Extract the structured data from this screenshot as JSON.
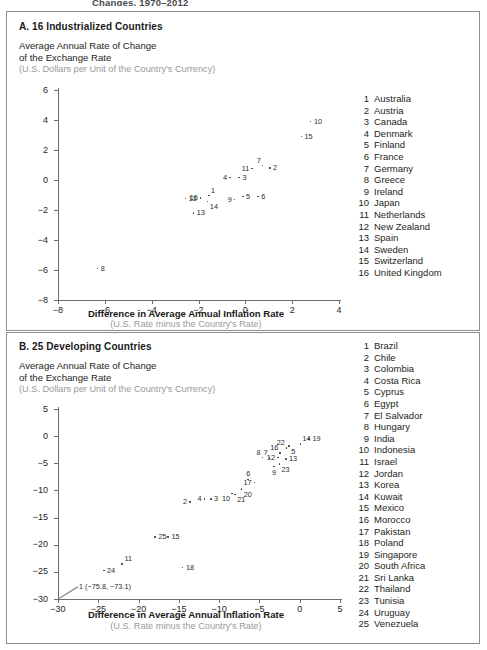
{
  "page": {
    "cut_off_heading": "Changes, 1970–2012"
  },
  "panel_a": {
    "title": "A. 16 Industrialized Countries",
    "ylabel_line1": "Average Annual Rate of Change",
    "ylabel_line2": "of the Exchange Rate",
    "ylabel_units": "(U.S. Dollars per Unit of the Country's Currency)",
    "xtitle": "Difference in Average Annual Inflation Rate",
    "xsub": "(U.S. Rate minus the Country's Rate)",
    "legend": [
      {
        "num": "1",
        "name": "Australia"
      },
      {
        "num": "2",
        "name": "Austria"
      },
      {
        "num": "3",
        "name": "Canada"
      },
      {
        "num": "4",
        "name": "Denmark"
      },
      {
        "num": "5",
        "name": "Finland"
      },
      {
        "num": "6",
        "name": "France"
      },
      {
        "num": "7",
        "name": "Germany"
      },
      {
        "num": "8",
        "name": "Greece"
      },
      {
        "num": "9",
        "name": "Ireland"
      },
      {
        "num": "10",
        "name": "Japan"
      },
      {
        "num": "11",
        "name": "Netherlands"
      },
      {
        "num": "12",
        "name": "New Zealand"
      },
      {
        "num": "13",
        "name": "Spain"
      },
      {
        "num": "14",
        "name": "Sweden"
      },
      {
        "num": "15",
        "name": "Switzerland"
      },
      {
        "num": "16",
        "name": "United Kingdom"
      }
    ]
  },
  "panel_b": {
    "title": "B. 25 Developing Countries",
    "ylabel_line1": "Average Annual Rate of Change",
    "ylabel_line2": "of the Exchange Rate",
    "ylabel_units": "(U.S. Dollars per Unit of the Country's Currency)",
    "xtitle": "Difference in Average Annual Inflation Rate",
    "xsub": "(U.S. Rate minus the Country's Rate)",
    "outlier_annotation": "1 (−75.8, −73.1)",
    "legend": [
      {
        "num": "1",
        "name": "Brazil"
      },
      {
        "num": "2",
        "name": "Chile"
      },
      {
        "num": "3",
        "name": "Colombia"
      },
      {
        "num": "4",
        "name": "Costa Rica"
      },
      {
        "num": "5",
        "name": "Cyprus"
      },
      {
        "num": "6",
        "name": "Egypt"
      },
      {
        "num": "7",
        "name": "El Salvador"
      },
      {
        "num": "8",
        "name": "Hungary"
      },
      {
        "num": "9",
        "name": "India"
      },
      {
        "num": "10",
        "name": "Indonesia"
      },
      {
        "num": "11",
        "name": "Israel"
      },
      {
        "num": "12",
        "name": "Jordan"
      },
      {
        "num": "13",
        "name": "Korea"
      },
      {
        "num": "14",
        "name": "Kuwait"
      },
      {
        "num": "15",
        "name": "Mexico"
      },
      {
        "num": "16",
        "name": "Morocco"
      },
      {
        "num": "17",
        "name": "Pakistan"
      },
      {
        "num": "18",
        "name": "Poland"
      },
      {
        "num": "19",
        "name": "Singapore"
      },
      {
        "num": "20",
        "name": "South Africa"
      },
      {
        "num": "21",
        "name": "Sri Lanka"
      },
      {
        "num": "22",
        "name": "Thailand"
      },
      {
        "num": "23",
        "name": "Tunisia"
      },
      {
        "num": "24",
        "name": "Uruguay"
      },
      {
        "num": "25",
        "name": "Venezuela"
      }
    ]
  },
  "chart_data": [
    {
      "type": "scatter",
      "title": "A. 16 Industrialized Countries",
      "xlabel": "Difference in Average Annual Inflation Rate (U.S. Rate minus the Country's Rate)",
      "ylabel": "Average Annual Rate of Change of the Exchange Rate (U.S. Dollars per Unit of the Country's Currency)",
      "xlim": [
        -8,
        4
      ],
      "ylim": [
        -8,
        6
      ],
      "xticks": [
        -8,
        -6,
        -4,
        -2,
        0,
        2,
        4
      ],
      "yticks": [
        -8,
        -6,
        -4,
        -2,
        0,
        2,
        4,
        6
      ],
      "grid": false,
      "legend_position": "right",
      "points": [
        {
          "label": "1",
          "name": "Australia",
          "x": -1.55,
          "y": -1.05,
          "lab": "lab-tr"
        },
        {
          "label": "2",
          "name": "Austria",
          "x": 1.05,
          "y": 0.8,
          "lab": "lab-r"
        },
        {
          "label": "3",
          "name": "Canada",
          "x": -0.25,
          "y": 0.15,
          "lab": "lab-r"
        },
        {
          "label": "4",
          "name": "Denmark",
          "x": -0.65,
          "y": 0.15,
          "lab": "lab-l"
        },
        {
          "label": "5",
          "name": "Finland",
          "x": -0.1,
          "y": -1.1,
          "lab": "lab-r"
        },
        {
          "label": "6",
          "name": "France",
          "x": 0.55,
          "y": -1.1,
          "lab": "lab-r"
        },
        {
          "label": "7",
          "name": "Germany",
          "x": 0.75,
          "y": 0.95,
          "lab": "lab-tl"
        },
        {
          "label": "8",
          "name": "Greece",
          "x": -6.3,
          "y": -5.9,
          "lab": "lab-r"
        },
        {
          "label": "9",
          "name": "Ireland",
          "x": -0.45,
          "y": -1.3,
          "lab": "lab-l"
        },
        {
          "label": "10",
          "name": "Japan",
          "x": 2.8,
          "y": 3.9,
          "lab": "lab-r"
        },
        {
          "label": "11",
          "name": "Netherlands",
          "x": 0.3,
          "y": 0.75,
          "lab": "lab-l"
        },
        {
          "label": "12",
          "name": "New Zealand",
          "x": -2.55,
          "y": -1.25,
          "lab": "lab-r"
        },
        {
          "label": "13",
          "name": "Spain",
          "x": -2.2,
          "y": -2.2,
          "lab": "lab-r"
        },
        {
          "label": "14",
          "name": "Sweden",
          "x": -1.6,
          "y": -1.45,
          "lab": "lab-br"
        },
        {
          "label": "15",
          "name": "Switzerland",
          "x": 2.4,
          "y": 2.9,
          "lab": "lab-r"
        },
        {
          "label": "16",
          "name": "United Kingdom",
          "x": -1.9,
          "y": -1.2,
          "lab": "lab-l"
        }
      ]
    },
    {
      "type": "scatter",
      "title": "B. 25 Developing Countries",
      "xlabel": "Difference in Average Annual Inflation Rate (U.S. Rate minus the Country's Rate)",
      "ylabel": "Average Annual Rate of Change of the Exchange Rate (U.S. Dollars per Unit of the Country's Currency)",
      "xlim": [
        -30,
        5
      ],
      "ylim": [
        -30,
        5
      ],
      "xticks": [
        -30,
        -25,
        -20,
        -15,
        -10,
        -5,
        0,
        5
      ],
      "yticks": [
        -30,
        -25,
        -20,
        -15,
        -10,
        -5,
        0,
        5
      ],
      "grid": false,
      "legend_position": "right",
      "annotations": [
        {
          "text": "1 (−75.8, −73.1)",
          "x": -30,
          "y": -30,
          "note": "off-scale outlier Brazil"
        }
      ],
      "points": [
        {
          "label": "1",
          "name": "Brazil",
          "x": -75.8,
          "y": -73.1,
          "offscale": true
        },
        {
          "label": "2",
          "name": "Chile",
          "x": -13.6,
          "y": -12.2,
          "lab": "lab-l"
        },
        {
          "label": "3",
          "name": "Colombia",
          "x": -11.0,
          "y": -11.6,
          "lab": "lab-r"
        },
        {
          "label": "4",
          "name": "Costa Rica",
          "x": -11.8,
          "y": -11.6,
          "lab": "lab-l"
        },
        {
          "label": "5",
          "name": "Cyprus",
          "x": -1.3,
          "y": -1.9,
          "lab": "lab-br"
        },
        {
          "label": "6",
          "name": "Egypt",
          "x": -6.4,
          "y": -8.0,
          "lab": "lab-t"
        },
        {
          "label": "7",
          "name": "El Salvador",
          "x": -3.7,
          "y": -4.1,
          "lab": "lab-tl"
        },
        {
          "label": "8",
          "name": "Hungary",
          "x": -4.6,
          "y": -4.0,
          "lab": "lab-tl"
        },
        {
          "label": "9",
          "name": "India",
          "x": -3.2,
          "y": -5.6,
          "lab": "lab-b"
        },
        {
          "label": "10",
          "name": "Indonesia",
          "x": -8.4,
          "y": -10.6,
          "lab": "lab-bl"
        },
        {
          "label": "11",
          "name": "Israel",
          "x": -22.0,
          "y": -23.6,
          "lab": "lab-tr"
        },
        {
          "label": "12",
          "name": "Jordan",
          "x": -2.7,
          "y": -4.0,
          "lab": "lab-l"
        },
        {
          "label": "13",
          "name": "Korea",
          "x": -1.7,
          "y": -4.2,
          "lab": "lab-r"
        },
        {
          "label": "14",
          "name": "Kuwait",
          "x": 0.1,
          "y": -1.5,
          "lab": "lab-tr"
        },
        {
          "label": "15",
          "name": "Mexico",
          "x": -16.3,
          "y": -18.6,
          "lab": "lab-r"
        },
        {
          "label": "16",
          "name": "Morocco",
          "x": -2.4,
          "y": -3.1,
          "lab": "lab-tl"
        },
        {
          "label": "17",
          "name": "Pakistan",
          "x": -5.6,
          "y": -8.6,
          "lab": "lab-l"
        },
        {
          "label": "18",
          "name": "Poland",
          "x": -14.5,
          "y": -24.2,
          "lab": "lab-r"
        },
        {
          "label": "19",
          "name": "Singapore",
          "x": 1.2,
          "y": -0.6,
          "lab": "lab-r"
        },
        {
          "label": "20",
          "name": "South Africa",
          "x": -7.2,
          "y": -9.8,
          "lab": "lab-br"
        },
        {
          "label": "21",
          "name": "Sri Lanka",
          "x": -8.0,
          "y": -10.8,
          "lab": "lab-br"
        },
        {
          "label": "22",
          "name": "Thailand",
          "x": -1.6,
          "y": -2.2,
          "lab": "lab-tl"
        },
        {
          "label": "23",
          "name": "Tunisia",
          "x": -2.5,
          "y": -5.2,
          "lab": "lab-br"
        },
        {
          "label": "24",
          "name": "Uruguay",
          "x": -24.3,
          "y": -24.8,
          "lab": "lab-r"
        },
        {
          "label": "25",
          "name": "Venezuela",
          "x": -17.9,
          "y": -18.6,
          "lab": "lab-r"
        }
      ]
    }
  ]
}
